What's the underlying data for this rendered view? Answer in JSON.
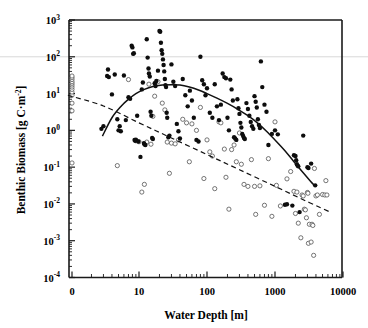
{
  "chart_data": {
    "type": "scatter",
    "title": "",
    "xlabel": "Water Depth [m]",
    "ylabel": "Benthic Biomass [g C·m⁻²]",
    "xscale": "log",
    "yscale": "log",
    "xlim": [
      0,
      10000
    ],
    "ylim": [
      0.0001,
      1000
    ],
    "xticks": [
      "0",
      "10",
      "100",
      "1000",
      "10000"
    ],
    "xtick_values": [
      0,
      10,
      100,
      1000,
      10000
    ],
    "yticks": [
      "10-4",
      "10-3",
      "10-2",
      "10-1",
      "100",
      "101",
      "102",
      "103"
    ],
    "ytick_exponents": [
      -4,
      -3,
      -2,
      -1,
      0,
      1,
      2,
      3
    ],
    "grid": false,
    "legend": "none",
    "gray_reference_line_y": 100,
    "series": [
      {
        "name": "filled-circles",
        "marker": "filled circle",
        "color": "#0d0d0d",
        "points": [
          [
            2.8,
            1.1
          ],
          [
            3.0,
            1.3
          ],
          [
            3.4,
            30
          ],
          [
            3.5,
            45
          ],
          [
            3.6,
            28
          ],
          [
            4.0,
            9.5
          ],
          [
            4.4,
            33
          ],
          [
            4.8,
            2.0
          ],
          [
            5.0,
            1.0
          ],
          [
            5.2,
            1.3
          ],
          [
            5.4,
            0.95
          ],
          [
            6.0,
            31
          ],
          [
            6.4,
            1.9
          ],
          [
            7.0,
            8.0
          ],
          [
            7.4,
            7.2
          ],
          [
            7.8,
            200
          ],
          [
            8.0,
            180
          ],
          [
            8.2,
            120
          ],
          [
            8.4,
            125
          ],
          [
            8.6,
            0.55
          ],
          [
            8.8,
            0.52
          ],
          [
            9.0,
            0.56
          ],
          [
            9.4,
            2.5
          ],
          [
            9.8,
            0.5
          ],
          [
            10.5,
            0.19
          ],
          [
            11.0,
            13
          ],
          [
            11.4,
            20
          ],
          [
            11.8,
            0.45
          ],
          [
            12.0,
            0.42
          ],
          [
            12.4,
            0.4
          ],
          [
            13.0,
            300
          ],
          [
            13.4,
            95
          ],
          [
            13.8,
            48
          ],
          [
            14.0,
            35
          ],
          [
            14.4,
            29
          ],
          [
            14.8,
            3.2
          ],
          [
            15.2,
            2.5
          ],
          [
            15.6,
            0.62
          ],
          [
            16.0,
            0.58
          ],
          [
            17.0,
            19
          ],
          [
            17.5,
            16
          ],
          [
            18.0,
            22
          ],
          [
            19.0,
            42
          ],
          [
            20.0,
            500
          ],
          [
            20.5,
            480
          ],
          [
            21.0,
            240
          ],
          [
            21.5,
            150
          ],
          [
            22.0,
            120
          ],
          [
            22.5,
            85
          ],
          [
            23.0,
            60
          ],
          [
            23.5,
            40
          ],
          [
            24.0,
            25
          ],
          [
            24.5,
            17
          ],
          [
            25.0,
            15
          ],
          [
            25.5,
            3.0
          ],
          [
            26.0,
            2.2
          ],
          [
            27.0,
            0.65
          ],
          [
            28.0,
            0.72
          ],
          [
            30.0,
            62
          ],
          [
            32.0,
            21
          ],
          [
            34.0,
            16
          ],
          [
            36.0,
            1.5
          ],
          [
            38.0,
            0.95
          ],
          [
            40.0,
            0.6
          ],
          [
            44.0,
            25
          ],
          [
            48.0,
            9.0
          ],
          [
            52.0,
            4.5
          ],
          [
            56.0,
            12
          ],
          [
            60.0,
            6.5
          ],
          [
            64.0,
            2.2
          ],
          [
            70.0,
            0.55
          ],
          [
            75.0,
            0.5
          ],
          [
            80.0,
            100
          ],
          [
            85.0,
            23
          ],
          [
            90.0,
            18
          ],
          [
            95.0,
            9.0
          ],
          [
            100.0,
            14
          ],
          [
            110.0,
            3.0
          ],
          [
            120.0,
            2.2
          ],
          [
            130.0,
            18
          ],
          [
            140.0,
            4.5
          ],
          [
            150.0,
            1.9
          ],
          [
            160.0,
            5.0
          ],
          [
            170.0,
            35
          ],
          [
            180.0,
            28
          ],
          [
            190.0,
            26
          ],
          [
            200.0,
            2.2
          ],
          [
            210.0,
            1.0
          ],
          [
            220.0,
            24
          ],
          [
            230.0,
            13
          ],
          [
            240.0,
            6.5
          ],
          [
            250.0,
            0.65
          ],
          [
            260.0,
            0.6
          ],
          [
            270.0,
            0.55
          ],
          [
            280.0,
            7.0
          ],
          [
            290.0,
            4.0
          ],
          [
            300.0,
            2.8
          ],
          [
            310.0,
            1.6
          ],
          [
            320.0,
            1.2
          ],
          [
            330.0,
            0.8
          ],
          [
            340.0,
            0.7
          ],
          [
            350.0,
            0.62
          ],
          [
            360.0,
            0.58
          ],
          [
            380.0,
            5.5
          ],
          [
            400.0,
            3.8
          ],
          [
            420.0,
            2.5
          ],
          [
            440.0,
            1.7
          ],
          [
            460.0,
            1.3
          ],
          [
            480.0,
            1.1
          ],
          [
            500.0,
            8.5
          ],
          [
            520.0,
            6.0
          ],
          [
            540.0,
            4.2
          ],
          [
            560.0,
            2.0
          ],
          [
            580.0,
            1.4
          ],
          [
            600.0,
            1.15
          ],
          [
            620.0,
            75
          ],
          [
            650.0,
            15
          ],
          [
            700.0,
            5.0
          ],
          [
            750.0,
            3.2
          ],
          [
            800.0,
            0.4
          ],
          [
            900.0,
            0.8
          ],
          [
            1000.0,
            1.0
          ],
          [
            1100.0,
            0.78
          ],
          [
            1400.0,
            0.0095
          ],
          [
            1500.0,
            0.0098
          ],
          [
            1800.0,
            0.009
          ],
          [
            1900.0,
            0.21
          ],
          [
            2000.0,
            0.2
          ],
          [
            2050.0,
            0.155
          ],
          [
            2100.0,
            0.12
          ],
          [
            2150.0,
            0.11
          ],
          [
            2200.0,
            0.105
          ],
          [
            2300.0,
            0.006
          ],
          [
            2600.0,
            0.72
          ],
          [
            3000.0,
            0.1
          ],
          [
            3100.0,
            0.095
          ],
          [
            3400.0,
            0.125
          ],
          [
            3900.0,
            0.032
          ]
        ]
      },
      {
        "name": "open-circles",
        "marker": "open circle",
        "color": "#4a4a4a",
        "points": [
          [
            0.0,
            0.13
          ],
          [
            0.0,
            3.4
          ],
          [
            0.0,
            5.5
          ],
          [
            0.0,
            9.0
          ],
          [
            0.0,
            11
          ],
          [
            0.0,
            13
          ],
          [
            0.0,
            15
          ],
          [
            0.0,
            17
          ],
          [
            0.0,
            19
          ],
          [
            0.0,
            21
          ],
          [
            0.0,
            24
          ],
          [
            0.0,
            27
          ],
          [
            0.0,
            30
          ],
          [
            4.8,
            0.11
          ],
          [
            7.0,
            24
          ],
          [
            9.0,
            0.52
          ],
          [
            10.0,
            0.49
          ],
          [
            11.0,
            0.021
          ],
          [
            12.0,
            0.034
          ],
          [
            13.0,
            0.48
          ],
          [
            14.0,
            18
          ],
          [
            15.0,
            0.42
          ],
          [
            16.0,
            2.4
          ],
          [
            17.0,
            8.5
          ],
          [
            19.0,
            21
          ],
          [
            22.0,
            5.5
          ],
          [
            24.0,
            3.6
          ],
          [
            26.0,
            0.48
          ],
          [
            28.0,
            0.068
          ],
          [
            30.0,
            0.45
          ],
          [
            34.0,
            0.43
          ],
          [
            38.0,
            0.55
          ],
          [
            44.0,
            2.0
          ],
          [
            50.0,
            1.6
          ],
          [
            55.0,
            0.14
          ],
          [
            60.0,
            1.5
          ],
          [
            70.0,
            1.0
          ],
          [
            80.0,
            4.2
          ],
          [
            90.0,
            0.049
          ],
          [
            100.0,
            0.55
          ],
          [
            110.0,
            0.26
          ],
          [
            120.0,
            0.2
          ],
          [
            130.0,
            0.026
          ],
          [
            150.0,
            1.7
          ],
          [
            160.0,
            1.6
          ],
          [
            180.0,
            0.31
          ],
          [
            190.0,
            0.053
          ],
          [
            210.0,
            0.0072
          ],
          [
            230.0,
            0.3
          ],
          [
            250.0,
            0.4
          ],
          [
            270.0,
            0.14
          ],
          [
            300.0,
            0.85
          ],
          [
            320.0,
            0.12
          ],
          [
            350.0,
            0.034
          ],
          [
            400.0,
            0.03
          ],
          [
            450.0,
            0.16
          ],
          [
            500.0,
            0.03
          ],
          [
            520.0,
            0.0052
          ],
          [
            600.0,
            0.031
          ],
          [
            700.0,
            0.0092
          ],
          [
            800.0,
            0.17
          ],
          [
            900.0,
            0.0046
          ],
          [
            1000.0,
            1.7
          ],
          [
            1050.0,
            0.032
          ],
          [
            1200.0,
            0.0088
          ],
          [
            1500.0,
            0.048
          ],
          [
            1700.0,
            0.076
          ],
          [
            1900.0,
            0.022
          ],
          [
            2000.0,
            0.0055
          ],
          [
            2100.0,
            0.021
          ],
          [
            2200.0,
            0.003
          ],
          [
            2400.0,
            0.0012
          ],
          [
            2500.0,
            0.0175
          ],
          [
            2600.0,
            0.0165
          ],
          [
            2700.0,
            0.0072
          ],
          [
            2800.0,
            0.0069
          ],
          [
            2900.0,
            0.0042
          ],
          [
            3000.0,
            0.0205
          ],
          [
            3050.0,
            0.0195
          ],
          [
            3100.0,
            0.00085
          ],
          [
            3200.0,
            0.0028
          ],
          [
            3400.0,
            0.00092
          ],
          [
            3500.0,
            0.0028
          ],
          [
            3600.0,
            0.0026
          ],
          [
            3700.0,
            0.0004
          ],
          [
            3800.0,
            0.092
          ],
          [
            4000.0,
            0.0165
          ],
          [
            4200.0,
            0.0175
          ],
          [
            4500.0,
            0.0052
          ],
          [
            5000.0,
            0.018
          ],
          [
            5400.0,
            0.0175
          ],
          [
            5600.0,
            0.043
          ],
          [
            5800.0,
            0.0175
          ]
        ]
      }
    ],
    "fits": [
      {
        "name": "solid-quadratic-fit",
        "style": "solid",
        "description": "Fit through filled circles: rises to peak near 25-40 m then declines",
        "points": [
          [
            2.9,
            0.7
          ],
          [
            4.0,
            2.2
          ],
          [
            5.5,
            4.6
          ],
          [
            7.0,
            7.0
          ],
          [
            9.0,
            10.0
          ],
          [
            12.0,
            13.0
          ],
          [
            16.0,
            15.5
          ],
          [
            22.0,
            17.0
          ],
          [
            30.0,
            17.5
          ],
          [
            40.0,
            17.0
          ],
          [
            55.0,
            15.0
          ],
          [
            75.0,
            12.5
          ],
          [
            100.0,
            10.0
          ],
          [
            140.0,
            7.5
          ],
          [
            200.0,
            5.4
          ],
          [
            280.0,
            3.8
          ],
          [
            400.0,
            2.5
          ],
          [
            550.0,
            1.6
          ],
          [
            750.0,
            0.95
          ],
          [
            1000.0,
            0.55
          ],
          [
            1400.0,
            0.28
          ],
          [
            1900.0,
            0.14
          ],
          [
            2600.0,
            0.07
          ],
          [
            3300.0,
            0.042
          ],
          [
            3900.0,
            0.03
          ]
        ]
      },
      {
        "name": "dashed-linear-fit",
        "style": "dashed",
        "description": "Fit through open circles: monotonic log-log decline",
        "points": [
          [
            0.9,
            9.0
          ],
          [
            3.0,
            4.6
          ],
          [
            10.0,
            1.6
          ],
          [
            30.0,
            0.62
          ],
          [
            100.0,
            0.22
          ],
          [
            300.0,
            0.085
          ],
          [
            1000.0,
            0.03
          ],
          [
            3000.0,
            0.0115
          ],
          [
            6500.0,
            0.006
          ]
        ]
      }
    ]
  },
  "axis": {
    "xlabel": "Water Depth [m]",
    "ylabel_prefix": "Benthic Biomass [g C",
    "ylabel_mid": "·m",
    "ylabel_sup": "-2",
    "ylabel_suffix": "]",
    "xtick_labels": [
      "0",
      "10",
      "100",
      "1000",
      "10000"
    ],
    "ytick_mantissa": "10",
    "ytick_exponents": [
      "3",
      "2",
      "1",
      "0",
      "-1",
      "-2",
      "-3",
      "-4"
    ]
  }
}
